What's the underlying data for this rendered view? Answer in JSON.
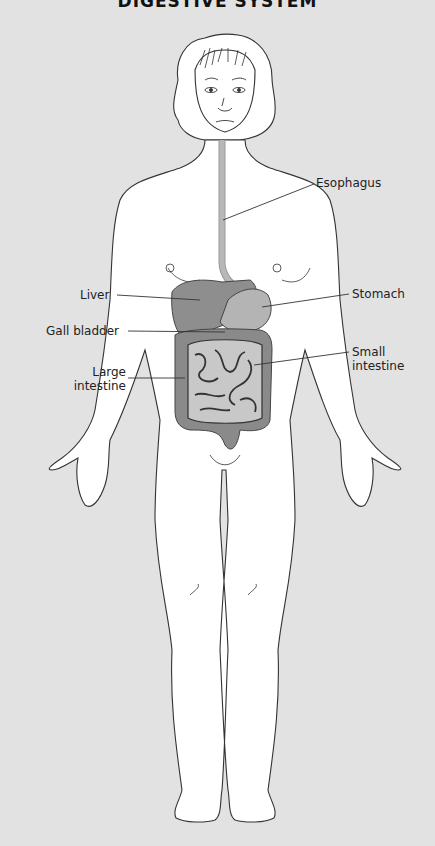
{
  "title": "DIGESTIVE SYSTEM",
  "colors": {
    "background": "#e2e2e2",
    "skin": "#ffffff",
    "outline": "#333333",
    "liver": "#8e8e8e",
    "stomach": "#b4b4b4",
    "small_intestine": "#c8c8c8",
    "large_intestine": "#8a8a8a",
    "esophagus": "#b8b8b8"
  },
  "labels": {
    "esophagus": "Esophagus",
    "stomach": "Stomach",
    "liver": "Liver",
    "gall_bladder": "Gall bladder",
    "large_intestine_1": "Large",
    "large_intestine_2": "intestine",
    "small_intestine_1": "Small",
    "small_intestine_2": "intestine"
  }
}
